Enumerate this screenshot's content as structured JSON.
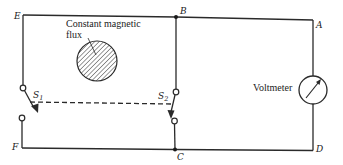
{
  "diagram": {
    "type": "circuit",
    "nodes": {
      "A": "A",
      "B": "B",
      "C": "C",
      "D": "D",
      "E": "E",
      "F": "F"
    },
    "flux_label_line1": "Constant magnetic",
    "flux_label_line2": "flux",
    "switches": {
      "s1": {
        "label": "S",
        "subscript": "1"
      },
      "s2": {
        "label": "S",
        "subscript": "2"
      }
    },
    "voltmeter_label": "Voltmeter",
    "colors": {
      "line": "#2a2a2a",
      "background": "#ffffff"
    }
  }
}
